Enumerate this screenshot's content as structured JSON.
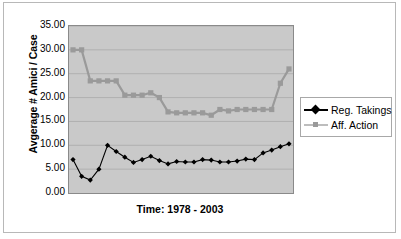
{
  "chart_data": {
    "type": "line",
    "title": "",
    "xlabel": "Time: 1978 - 2003",
    "ylabel": "Avgerage # Amici / Case",
    "ylim": [
      0,
      35
    ],
    "ytick_labels": [
      "35.00",
      "30.00",
      "25.00",
      "20.00",
      "15.00",
      "10.00",
      "5.00",
      "0.00"
    ],
    "ytick_values": [
      35,
      30,
      25,
      20,
      15,
      10,
      5,
      0
    ],
    "xtick_labels": [],
    "grid": true,
    "legend_position": "right",
    "plot_background": "#c9c9c9",
    "x": [
      1978,
      1979,
      1980,
      1981,
      1982,
      1983,
      1984,
      1985,
      1986,
      1987,
      1988,
      1989,
      1990,
      1991,
      1992,
      1993,
      1994,
      1995,
      1996,
      1997,
      1998,
      1999,
      2000,
      2001,
      2002,
      2003
    ],
    "series": [
      {
        "name": "Reg. Takings",
        "color": "#000000",
        "marker": "diamond",
        "values": [
          7.0,
          3.5,
          2.7,
          5.0,
          10.0,
          8.7,
          7.5,
          6.4,
          7.0,
          7.7,
          6.8,
          6.1,
          6.6,
          6.5,
          6.5,
          7.0,
          6.9,
          6.5,
          6.5,
          6.7,
          7.1,
          7.0,
          8.4,
          9.0,
          9.7,
          10.3
        ]
      },
      {
        "name": "Aff. Action",
        "color": "#9a9a9a",
        "marker": "square",
        "values": [
          30.0,
          30.0,
          23.5,
          23.5,
          23.5,
          23.5,
          20.5,
          20.5,
          20.5,
          21.0,
          20.0,
          17.0,
          16.8,
          16.8,
          16.8,
          16.8,
          16.3,
          17.5,
          17.2,
          17.5,
          17.5,
          17.5,
          17.5,
          17.5,
          23.0,
          26.0
        ]
      }
    ]
  },
  "legend": {
    "items": [
      {
        "label": "Reg. Takings",
        "marker": "diamond",
        "color": "#000000"
      },
      {
        "label": "Aff. Action",
        "marker": "square",
        "color": "#9a9a9a"
      }
    ]
  },
  "axes": {
    "y_title": "Avgerage # Amici / Case",
    "x_title": "Time: 1978 - 2003"
  }
}
